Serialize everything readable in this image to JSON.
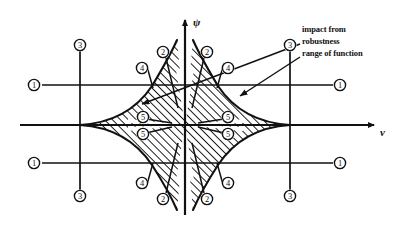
{
  "figure": {
    "background": "#ffffff",
    "ink": "#111111",
    "hatch_color": "#1a1a1a"
  },
  "axes": {
    "x_label": "ν",
    "y_label": "ψ",
    "origin": {
      "x": 185,
      "y": 125
    },
    "x_axis": {
      "x1": 20,
      "y1": 125,
      "x2": 380,
      "y2": 125
    },
    "y_axis": {
      "x1": 185,
      "y1": 215,
      "x2": 185,
      "y2": 14
    }
  },
  "gridlines": {
    "vertical": [
      {
        "name": "left-gridline",
        "x": 80,
        "y1": 40,
        "y2": 200
      },
      {
        "name": "right-gridline",
        "x": 290,
        "y1": 40,
        "y2": 200
      }
    ],
    "horizontal": [
      {
        "name": "upper-gridline",
        "y": 85,
        "x1": 42,
        "x2": 333
      },
      {
        "name": "lower-gridline",
        "y": 163,
        "x1": 42,
        "x2": 333
      }
    ]
  },
  "callouts": {
    "items": [
      {
        "id": "impact",
        "label": "impact from",
        "x": 302,
        "y": 28
      },
      {
        "id": "robustness",
        "label": "robustness",
        "x": 302,
        "y": 41
      },
      {
        "id": "range",
        "label": "range of function",
        "x": 302,
        "y": 54
      }
    ],
    "leaders": [
      {
        "from_x": 300,
        "from_y": 45,
        "to_x": 136,
        "to_y": 104
      },
      {
        "from_x": 300,
        "from_y": 58,
        "to_x": 235,
        "to_y": 97
      }
    ]
  },
  "markers": {
    "description": "Encircled region-number annotations placed around the diagram",
    "items": [
      {
        "n": "1",
        "x": 34,
        "y": 85,
        "name": "marker-1-top-left"
      },
      {
        "n": "1",
        "x": 340,
        "y": 85,
        "name": "marker-1-top-right"
      },
      {
        "n": "1",
        "x": 34,
        "y": 163,
        "name": "marker-1-bottom-left"
      },
      {
        "n": "1",
        "x": 340,
        "y": 163,
        "name": "marker-1-bottom-right"
      },
      {
        "n": "3",
        "x": 80,
        "y": 45,
        "name": "marker-3-top-left"
      },
      {
        "n": "3",
        "x": 290,
        "y": 45,
        "name": "marker-3-top-right"
      },
      {
        "n": "3",
        "x": 80,
        "y": 196,
        "name": "marker-3-bottom-left"
      },
      {
        "n": "3",
        "x": 290,
        "y": 196,
        "name": "marker-3-bottom-right"
      },
      {
        "n": "2",
        "x": 163,
        "y": 52,
        "name": "marker-2-top-left"
      },
      {
        "n": "2",
        "x": 207,
        "y": 52,
        "name": "marker-2-top-right"
      },
      {
        "n": "2",
        "x": 163,
        "y": 199,
        "name": "marker-2-bottom-left"
      },
      {
        "n": "2",
        "x": 207,
        "y": 199,
        "name": "marker-2-bottom-right"
      },
      {
        "n": "4",
        "x": 142,
        "y": 68,
        "name": "marker-4-top-left"
      },
      {
        "n": "4",
        "x": 228,
        "y": 68,
        "name": "marker-4-top-right"
      },
      {
        "n": "4",
        "x": 142,
        "y": 183,
        "name": "marker-4-bottom-left"
      },
      {
        "n": "4",
        "x": 228,
        "y": 183,
        "name": "marker-4-bottom-right"
      },
      {
        "n": "5",
        "x": 143,
        "y": 117,
        "name": "marker-5-left-upper"
      },
      {
        "n": "5",
        "x": 143,
        "y": 134,
        "name": "marker-5-left-lower"
      },
      {
        "n": "5",
        "x": 228,
        "y": 117,
        "name": "marker-5-right-upper"
      },
      {
        "n": "5",
        "x": 228,
        "y": 134,
        "name": "marker-5-right-lower"
      }
    ],
    "leader_lines": [
      {
        "x1": 146,
        "y1": 62,
        "x2": 152,
        "y2": 86,
        "name": "leader-4-top-left"
      },
      {
        "x1": 224,
        "y1": 62,
        "x2": 218,
        "y2": 86,
        "name": "leader-4-top-right"
      },
      {
        "x1": 146,
        "y1": 189,
        "x2": 152,
        "y2": 165,
        "name": "leader-4-bottom-left"
      },
      {
        "x1": 224,
        "y1": 189,
        "x2": 218,
        "y2": 165,
        "name": "leader-4-bottom-right"
      },
      {
        "x1": 165,
        "y1": 58,
        "x2": 177,
        "y2": 105,
        "name": "leader-2-top-left"
      },
      {
        "x1": 205,
        "y1": 58,
        "x2": 193,
        "y2": 105,
        "name": "leader-2-top-right"
      },
      {
        "x1": 165,
        "y1": 193,
        "x2": 177,
        "y2": 146,
        "name": "leader-2-bottom-left"
      },
      {
        "x1": 205,
        "y1": 193,
        "x2": 193,
        "y2": 146,
        "name": "leader-2-bottom-right"
      }
    ]
  },
  "regions": {
    "left_lobe": {
      "name": "left-hatched-lobe",
      "tip_x": 80,
      "center_x": 185,
      "half_height": 53
    },
    "right_lobe": {
      "name": "right-hatched-lobe",
      "tip_x": 290,
      "center_x": 185,
      "half_height": 53
    },
    "hatch_angle_deg": 45,
    "hatch_spacing_px": 4
  },
  "wedges": {
    "description": "White bowtie wedges radiating from the origin, marked 5",
    "count": 4
  }
}
